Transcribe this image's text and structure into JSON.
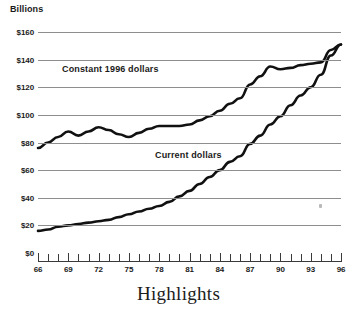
{
  "figure": {
    "caption": "Highlights"
  },
  "chart_data": {
    "type": "line",
    "title": "",
    "subtitle": "",
    "xlabel": "",
    "ylabel": "Billions",
    "axis_unit_label": "Billions",
    "grid": true,
    "legend_position": "inline-annotations",
    "xlim": [
      66,
      96
    ],
    "ylim": [
      0,
      160
    ],
    "ytick_labels": [
      "$160",
      "$140",
      "$120",
      "$100",
      "$80",
      "$60",
      "$40",
      "$20",
      "$0"
    ],
    "ytick_values": [
      160,
      140,
      120,
      100,
      80,
      60,
      40,
      20,
      0
    ],
    "xtick_labels": [
      "66",
      "69",
      "72",
      "75",
      "78",
      "81",
      "84",
      "87",
      "90",
      "93",
      "96"
    ],
    "xtick_values": [
      66,
      69,
      72,
      75,
      78,
      81,
      84,
      87,
      90,
      93,
      96
    ],
    "x_minor_tick_interval": 1,
    "x": [
      66,
      67,
      68,
      69,
      70,
      71,
      72,
      73,
      74,
      75,
      76,
      77,
      78,
      79,
      80,
      81,
      82,
      83,
      84,
      85,
      86,
      87,
      88,
      89,
      90,
      91,
      92,
      93,
      94,
      95,
      96
    ],
    "series": [
      {
        "name": "Constant 1996 dollars",
        "annotation": "Constant 1996 dollars",
        "color": "#111111",
        "values": [
          76,
          80,
          84,
          88,
          85,
          88,
          91,
          89,
          86,
          84,
          87,
          90,
          92,
          92,
          92,
          93,
          96,
          99,
          103,
          108,
          112,
          122,
          128,
          135,
          133,
          134,
          136,
          137,
          138,
          147,
          151
        ]
      },
      {
        "name": "Current dollars",
        "annotation": "Current dollars",
        "color": "#111111",
        "values": [
          16,
          17,
          19,
          20,
          21,
          22,
          23,
          24,
          26,
          28,
          30,
          32,
          34,
          37,
          41,
          45,
          50,
          55,
          60,
          66,
          70,
          79,
          85,
          93,
          99,
          107,
          114,
          120,
          129,
          143,
          151
        ]
      }
    ],
    "annotations": [
      {
        "text": "Constant 1996 dollars",
        "series": "Constant 1996 dollars"
      },
      {
        "text": "Current dollars",
        "series": "Current dollars"
      }
    ]
  }
}
